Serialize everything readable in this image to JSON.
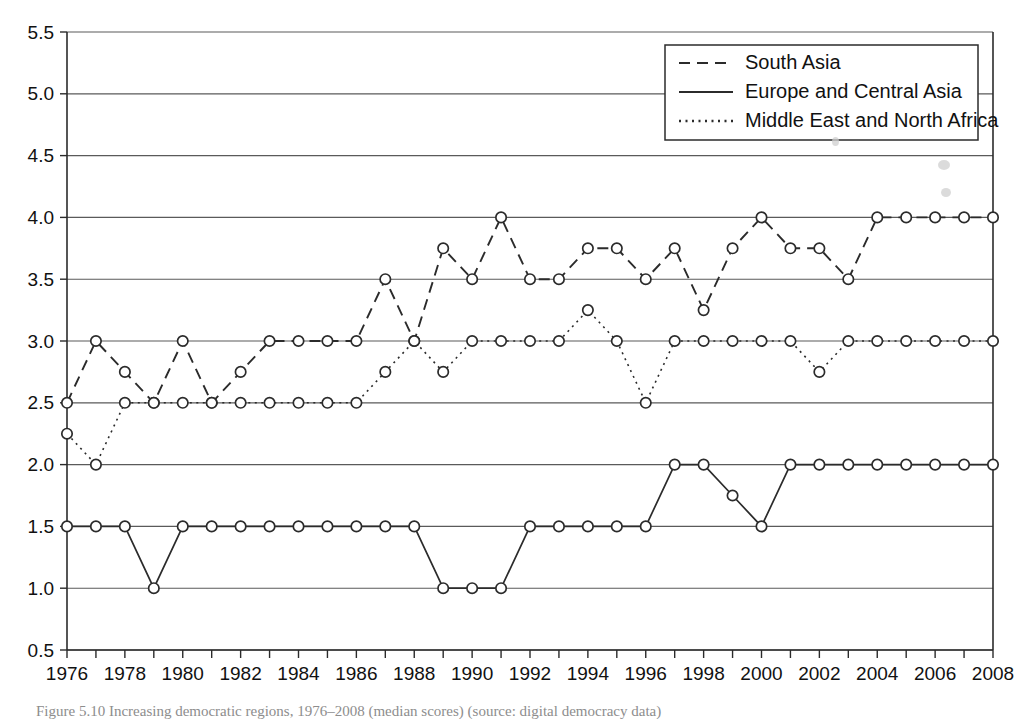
{
  "figure": {
    "caption": "Figure 5.10 Increasing democratic regions, 1976–2008 (median scores) (source: digital democracy data)"
  },
  "legend": {
    "position": "top-right",
    "entries": [
      {
        "label": "South Asia",
        "style": "dashed"
      },
      {
        "label": "Europe and Central Asia",
        "style": "solid"
      },
      {
        "label": "Middle East and North Africa",
        "style": "dotted"
      }
    ]
  },
  "axes": {
    "y_tick_labels": [
      "5.5",
      "5.0",
      "4.5",
      "4.0",
      "3.5",
      "3.0",
      "2.5",
      "2.0",
      "1.5",
      "1.0",
      "0.5"
    ],
    "x_tick_labels": [
      "1976",
      "1978",
      "1980",
      "1982",
      "1984",
      "1986",
      "1988",
      "1990",
      "1992",
      "1994",
      "1996",
      "1998",
      "2000",
      "2002",
      "2004",
      "2006",
      "2008"
    ]
  },
  "chart_data": {
    "type": "line",
    "title": "",
    "xlabel": "",
    "ylabel": "",
    "xlim": [
      1976,
      2008
    ],
    "ylim": [
      0.5,
      5.5
    ],
    "grid": true,
    "legend_position": "top-right",
    "marker": "open-circle",
    "x": [
      1976,
      1977,
      1978,
      1979,
      1980,
      1981,
      1982,
      1983,
      1984,
      1985,
      1986,
      1987,
      1988,
      1989,
      1990,
      1991,
      1992,
      1993,
      1994,
      1995,
      1996,
      1997,
      1998,
      1999,
      2000,
      2001,
      2002,
      2003,
      2004,
      2005,
      2006,
      2007,
      2008
    ],
    "series": [
      {
        "name": "South Asia",
        "style": "dashed",
        "values": [
          2.5,
          3.0,
          2.75,
          2.5,
          3.0,
          2.5,
          2.75,
          3.0,
          3.0,
          3.0,
          3.0,
          3.5,
          3.0,
          3.75,
          3.5,
          4.0,
          3.5,
          3.5,
          3.75,
          3.75,
          3.5,
          3.75,
          3.25,
          3.75,
          4.0,
          3.75,
          3.75,
          3.5,
          4.0,
          4.0,
          4.0,
          4.0,
          4.0
        ]
      },
      {
        "name": "Europe and Central Asia",
        "style": "solid",
        "values": [
          1.5,
          1.5,
          1.5,
          1.0,
          1.5,
          1.5,
          1.5,
          1.5,
          1.5,
          1.5,
          1.5,
          1.5,
          1.5,
          1.0,
          1.0,
          1.0,
          1.5,
          1.5,
          1.5,
          1.5,
          1.5,
          2.0,
          2.0,
          1.75,
          1.5,
          2.0,
          2.0,
          2.0,
          2.0,
          2.0,
          2.0,
          2.0,
          2.0
        ]
      },
      {
        "name": "Middle East and North Africa",
        "style": "dotted",
        "values": [
          2.25,
          2.0,
          2.5,
          2.5,
          2.5,
          2.5,
          2.5,
          2.5,
          2.5,
          2.5,
          2.5,
          2.75,
          3.0,
          2.75,
          3.0,
          3.0,
          3.0,
          3.0,
          3.25,
          3.0,
          2.5,
          3.0,
          3.0,
          3.0,
          3.0,
          3.0,
          2.75,
          3.0,
          3.0,
          3.0,
          3.0,
          3.0,
          3.0
        ]
      }
    ]
  }
}
